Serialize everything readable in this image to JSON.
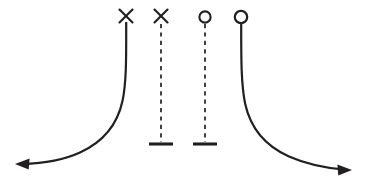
{
  "figure": {
    "title": "",
    "background_color": "#ffffff",
    "stroke_color": "#231f20",
    "width": 365,
    "height": 191
  },
  "chart_data": {
    "type": "line",
    "title": "",
    "xlabel": "",
    "ylabel": "",
    "grid": false,
    "legend": false,
    "axis_ranges": {
      "x": [
        0,
        365
      ],
      "y": [
        0,
        191
      ]
    },
    "series": [
      {
        "name": "left-branch",
        "style": "solid",
        "marker_top": "cross",
        "arrow_end": "left",
        "path_points": [
          [
            126,
            22
          ],
          [
            126,
            60
          ],
          [
            124,
            95
          ],
          [
            112,
            125
          ],
          [
            88,
            148
          ],
          [
            55,
            160
          ],
          [
            22,
            164
          ]
        ]
      },
      {
        "name": "left-dashed-segment",
        "style": "dashed",
        "marker_top": "cross",
        "marker_bottom": "bar",
        "path_points": [
          [
            161,
            24
          ],
          [
            161,
            142
          ]
        ]
      },
      {
        "name": "right-dashed-segment",
        "style": "dashed",
        "marker_top": "circle",
        "marker_bottom": "bar",
        "path_points": [
          [
            205,
            24
          ],
          [
            205,
            142
          ]
        ]
      },
      {
        "name": "right-branch",
        "style": "solid",
        "marker_top": "circle",
        "arrow_end": "right",
        "path_points": [
          [
            241,
            24
          ],
          [
            241,
            62
          ],
          [
            243,
            98
          ],
          [
            255,
            128
          ],
          [
            281,
            152
          ],
          [
            316,
            166
          ],
          [
            345,
            170
          ]
        ]
      }
    ],
    "markers": [
      {
        "id": "marker-cross-1",
        "shape": "cross",
        "x": 126,
        "y": 16,
        "size": 13
      },
      {
        "id": "marker-cross-2",
        "shape": "cross",
        "x": 161,
        "y": 16,
        "size": 13
      },
      {
        "id": "marker-circle-1",
        "shape": "open-circle",
        "x": 205,
        "y": 17,
        "radius": 5.6
      },
      {
        "id": "marker-circle-2",
        "shape": "open-circle",
        "x": 241,
        "y": 17,
        "radius": 6.2
      }
    ],
    "end_caps": [
      {
        "id": "bar-cap-left",
        "shape": "horizontal-bar",
        "x": 161,
        "y": 144,
        "half_width": 12
      },
      {
        "id": "bar-cap-right",
        "shape": "horizontal-bar",
        "x": 205,
        "y": 144,
        "half_width": 12
      }
    ],
    "arrows": [
      {
        "id": "arrow-left",
        "direction": "left",
        "tip_x": 15,
        "tip_y": 164
      },
      {
        "id": "arrow-right",
        "direction": "right",
        "tip_x": 352,
        "tip_y": 170
      }
    ]
  }
}
